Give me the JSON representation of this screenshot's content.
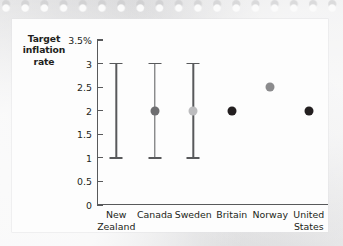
{
  "chart_data": {
    "type": "scatter",
    "title": "",
    "ylabel": "Target inflation rate",
    "xlabel": "",
    "ylim": [
      0,
      3.5
    ],
    "grid": false,
    "legend": "none",
    "y_unit": "%",
    "y_ticks": [
      {
        "value": 3.5,
        "label": "3.5%"
      },
      {
        "value": 3,
        "label": "3"
      },
      {
        "value": 2.5,
        "label": "2.5"
      },
      {
        "value": 2,
        "label": "2"
      },
      {
        "value": 1.5,
        "label": "1.5"
      },
      {
        "value": 1,
        "label": "1"
      },
      {
        "value": 0.5,
        "label": "0.5"
      },
      {
        "value": 0,
        "label": "0"
      }
    ],
    "categories": [
      "New Zealand",
      "Canada",
      "Sweden",
      "Britain",
      "Norway",
      "United States"
    ],
    "points": [
      {
        "category": "New Zealand",
        "label_lines": [
          "New",
          "Zealand"
        ],
        "range_low": 1,
        "range_high": 3,
        "target": null,
        "dot_color": "#000000",
        "has_dot": false
      },
      {
        "category": "Canada",
        "label_lines": [
          "Canada"
        ],
        "range_low": 1,
        "range_high": 3,
        "target": 2,
        "dot_color": "#6e6e70",
        "has_dot": true
      },
      {
        "category": "Sweden",
        "label_lines": [
          "Sweden"
        ],
        "range_low": 1,
        "range_high": 3,
        "target": 2,
        "dot_color": "#bcbcbe",
        "has_dot": true
      },
      {
        "category": "Britain",
        "label_lines": [
          "Britain"
        ],
        "range_low": null,
        "range_high": null,
        "target": 2,
        "dot_color": "#231f20",
        "has_dot": true
      },
      {
        "category": "Norway",
        "label_lines": [
          "Norway"
        ],
        "range_low": null,
        "range_high": null,
        "target": 2.5,
        "dot_color": "#8b8b8d",
        "has_dot": true
      },
      {
        "category": "United States",
        "label_lines": [
          "United",
          "States"
        ],
        "range_low": null,
        "range_high": null,
        "target": 2,
        "dot_color": "#231f20",
        "has_dot": true
      }
    ],
    "axis_color": "#58595b"
  }
}
